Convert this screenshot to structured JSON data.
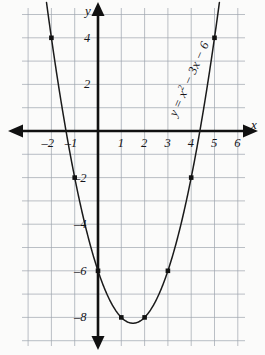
{
  "chart_data": {
    "type": "line",
    "title": "",
    "xlabel": "x",
    "ylabel": "y",
    "equation_label": "y = x² − 3x − 6",
    "equation_parts": {
      "lhs": "y = x",
      "exponent": "2",
      "rhs": " − 3x − 6"
    },
    "grid": true,
    "legend": "none",
    "xlim": [
      -3,
      7
    ],
    "ylim": [
      -9,
      5
    ],
    "x_ticks": [
      -2,
      -1,
      1,
      2,
      3,
      4,
      5,
      6
    ],
    "x_tick_labels": [
      "–2",
      "–1",
      "1",
      "2",
      "3",
      "4",
      "5",
      "6"
    ],
    "y_ticks": [
      4,
      2,
      -2,
      -4,
      -6,
      -8
    ],
    "y_tick_labels": [
      "4",
      "2",
      "–2",
      "–4",
      "–6",
      "–8"
    ],
    "x_minor_step": 1,
    "y_minor_step": 1,
    "series": [
      {
        "name": "y = x² − 3x − 6",
        "x": [
          -2,
          -1,
          0,
          1,
          2,
          3,
          4,
          5
        ],
        "values": [
          4,
          -2,
          -6,
          -8,
          -8,
          -6,
          -2,
          4
        ],
        "marked_points": [
          {
            "x": -2,
            "y": 4
          },
          {
            "x": -1,
            "y": -2
          },
          {
            "x": 0,
            "y": -6
          },
          {
            "x": 1,
            "y": -8
          },
          {
            "x": 2,
            "y": -8
          },
          {
            "x": 3,
            "y": -6
          },
          {
            "x": 4,
            "y": -2
          },
          {
            "x": 5,
            "y": 4
          }
        ]
      }
    ],
    "colors": {
      "curve": "#1a1a1a",
      "axis": "#111111",
      "grid": "#9aa0aa",
      "background": "#fbfbfa",
      "marker": "#111111"
    }
  },
  "axes": {
    "x_axis_name": "x",
    "y_axis_name": "y"
  }
}
